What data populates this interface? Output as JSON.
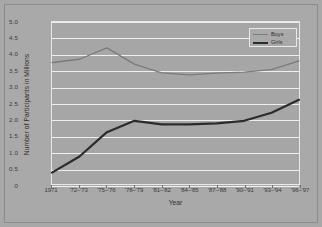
{
  "axis": {
    "ylabel": "Number of Participants in Millions",
    "xlabel": "Year",
    "yticks": [
      "5.0",
      "4.5",
      "4.0",
      "3.5",
      "3.0",
      "2.5",
      "2.0",
      "1.5",
      "1.0",
      "0.5",
      "0"
    ],
    "xticks": [
      "1971",
      "'72–'73",
      "'75–'76",
      "'78–'79",
      "'81–'82",
      "'84–'85",
      "'87–'88",
      "'90–'91",
      "'93–'94",
      "'96–'97"
    ]
  },
  "legend": {
    "boys_label": "Boys",
    "girls_label": "Girls"
  },
  "colors": {
    "background": "#a9a9a9",
    "plot_background": "#a6a6a6",
    "gridline": "#efefef",
    "boys_line": "#7b7b7b",
    "girls_line": "#2b2b2b"
  },
  "chart_data": {
    "type": "line",
    "title": "",
    "xlabel": "Year",
    "ylabel": "Number of Participants in Millions",
    "ylim": [
      0,
      5.0
    ],
    "ytick_values": [
      0,
      0.5,
      1.0,
      1.5,
      2.0,
      2.5,
      3.0,
      3.5,
      4.0,
      4.5,
      5.0
    ],
    "grid": true,
    "legend_position": "top-right",
    "categories": [
      "1971",
      "'72–'73",
      "'75–'76",
      "'78–'79",
      "'81–'82",
      "'84–'85",
      "'87–'88",
      "'90–'91",
      "'93–'94",
      "'96–'97"
    ],
    "series": [
      {
        "name": "Boys",
        "values": [
          3.75,
          3.85,
          4.2,
          3.7,
          3.43,
          3.37,
          3.42,
          3.45,
          3.53,
          3.8
        ]
      },
      {
        "name": "Girls",
        "values": [
          0.35,
          0.85,
          1.6,
          1.95,
          1.84,
          1.84,
          1.87,
          1.95,
          2.2,
          2.6
        ]
      }
    ]
  }
}
